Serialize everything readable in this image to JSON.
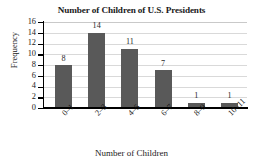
{
  "chart_data": {
    "type": "bar",
    "title": "Number of Children of U.S. Presidents",
    "xlabel": "Number of Children",
    "ylabel": "Frequency",
    "categories": [
      "0–1",
      "2–3",
      "4–5",
      "6–7",
      "8–9",
      "10–11"
    ],
    "values": [
      8,
      14,
      11,
      7,
      1,
      1
    ],
    "value_labels": [
      "8",
      "14",
      "11",
      "7",
      "1",
      "1"
    ],
    "ylim": [
      0,
      16
    ],
    "ytick_labels": [
      "0",
      "2",
      "4",
      "6",
      "8",
      "10",
      "12",
      "14",
      "16"
    ],
    "ytick_values": [
      0,
      2,
      4,
      6,
      8,
      10,
      12,
      14,
      16
    ],
    "grid": "horizontal",
    "legend": "none",
    "bar_color": "#595959",
    "gridline_color": "#d9d9d9",
    "axis_color": "#000000",
    "background_color": "#ffffff"
  }
}
